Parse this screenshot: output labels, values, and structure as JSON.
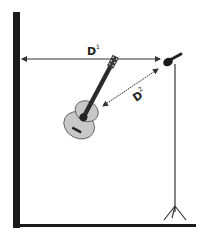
{
  "diagram": {
    "labels": {
      "d1": "D",
      "d1_sup": "1",
      "d2": "D",
      "d2_sup": "2"
    },
    "colors": {
      "wall": "#1a1a1a",
      "guitar_body": "#c8c8c8",
      "guitar_neck": "#2a2a2a",
      "lines": "#333333"
    }
  }
}
